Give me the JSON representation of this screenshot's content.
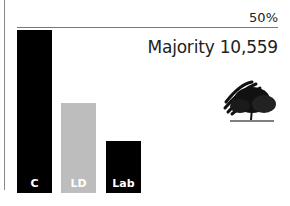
{
  "header": {
    "threshold_label": "50%",
    "majority_label": "Majority 10,559"
  },
  "logo": {
    "icon": "oak-tree-icon",
    "party": "Conservative"
  },
  "chart_data": {
    "type": "bar",
    "title": "",
    "categories": [
      "C",
      "LD",
      "Lab"
    ],
    "values": [
      56,
      31,
      18
    ],
    "colors": [
      "#000000",
      "#bdbdbd",
      "#000000"
    ],
    "reference_line": {
      "label": "50%",
      "value": 50
    },
    "annotation": "Majority 10,559",
    "xlabel": "",
    "ylabel": "",
    "ylim": [
      0,
      56
    ],
    "grid": false,
    "legend": "none"
  }
}
